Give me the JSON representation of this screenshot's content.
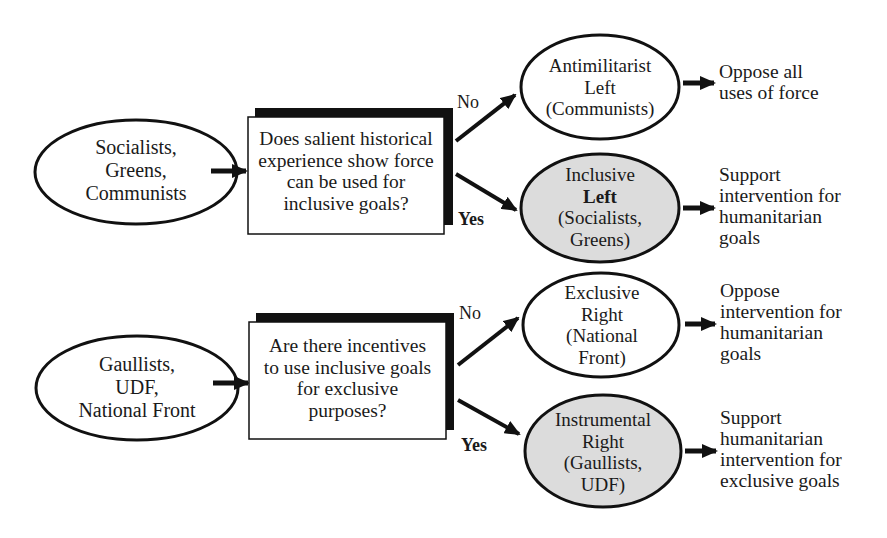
{
  "colors": {
    "ink": "#111111",
    "shaded": "#dcdcdc",
    "background": "#ffffff"
  },
  "top_flow": {
    "start": {
      "lines": [
        "Socialists,",
        "Greens,",
        "Communists"
      ]
    },
    "question": {
      "lines": [
        "Does salient historical",
        "experience show force",
        "can be used for",
        "inclusive goals?"
      ]
    },
    "no_label": "No",
    "yes_label": "Yes",
    "no_outcome": {
      "lines": [
        "Antimilitarist",
        "Left",
        "(Communists)"
      ],
      "shaded": false
    },
    "yes_outcome": {
      "lines": [
        "Inclusive",
        "Left",
        "(Socialists,",
        "Greens)"
      ],
      "shaded": true
    },
    "no_result": {
      "lines": [
        "Oppose all",
        "uses of force"
      ]
    },
    "yes_result": {
      "lines": [
        "Support",
        "intervention for",
        "humanitarian",
        "goals"
      ]
    }
  },
  "bottom_flow": {
    "start": {
      "lines": [
        "Gaullists,",
        "UDF,",
        "National Front"
      ]
    },
    "question": {
      "lines": [
        "Are there incentives",
        "to use inclusive goals",
        "for exclusive",
        "purposes?"
      ]
    },
    "no_label": "No",
    "yes_label": "Yes",
    "no_outcome": {
      "lines": [
        "Exclusive",
        "Right",
        "(National",
        "Front)"
      ],
      "shaded": false
    },
    "yes_outcome": {
      "lines": [
        "Instrumental",
        "Right",
        "(Gaullists,",
        "UDF)"
      ],
      "shaded": true
    },
    "no_result": {
      "lines": [
        "Oppose",
        "intervention for",
        "humanitarian",
        "goals"
      ]
    },
    "yes_result": {
      "lines": [
        "Support",
        "humanitarian",
        "intervention for",
        "exclusive goals"
      ]
    }
  }
}
